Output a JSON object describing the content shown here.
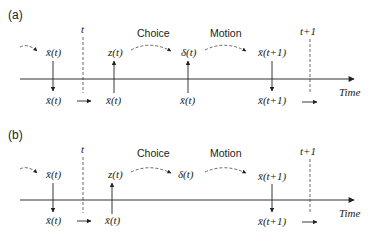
{
  "panels": [
    {
      "label": "(a)",
      "t_label": "t",
      "t1_label": "t+1",
      "choice_label": "Choice",
      "motion_label": "Motion",
      "axis_label": "Time",
      "top": {
        "x1": "x̄(t)",
        "z": "z(t)",
        "delta": "δ(t)",
        "x2": "x̄(t+1)"
      },
      "bottom": {
        "x1": "x̄(t)",
        "xz": "x̄(t)",
        "xd": "x̄(t)",
        "x2": "x̄(t+1)"
      },
      "delta_has_input": true
    },
    {
      "label": "(b)",
      "t_label": "t",
      "t1_label": "t+1",
      "choice_label": "Choice",
      "motion_label": "Motion",
      "axis_label": "Time",
      "top": {
        "x1": "x̄(t)",
        "z": "z(t)",
        "delta": "δ(t)",
        "x2": "x̄(t+1)"
      },
      "bottom": {
        "x1": "x̄(t)",
        "xz": "x̄(t)",
        "xd": "",
        "x2": "x̄(t+1)"
      },
      "delta_has_input": false
    }
  ]
}
